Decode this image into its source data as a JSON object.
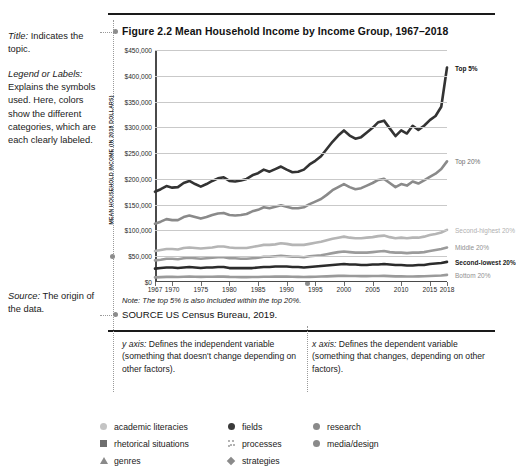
{
  "annotations": {
    "title_note": {
      "lead": "Title:",
      "body": " Indicates the topic."
    },
    "legend_note": {
      "lead": "Legend or Labels:",
      "body": " Explains the symbols used. Here, colors show the different categories, which are each clearly labeled."
    },
    "source_note": {
      "lead": "Source:",
      "body": " The origin of the data."
    },
    "y_axis_def": {
      "lead": "y axis:",
      "body": " Defines the independent variable (something that doesn't change depending on other factors)."
    },
    "x_axis_def": {
      "lead": "x axis:",
      "body": " Defines the dependent variable (something that changes, depending on other factors)."
    }
  },
  "figure": {
    "title": "Figure 2.2  Mean Household Income by Income Group, 1967–2018",
    "note": "Note: The top 5% is also included within the top 20%.",
    "source": "SOURCE  US Census Bureau, 2019."
  },
  "chart_data": {
    "type": "line",
    "title": "Figure 2.2  Mean Household Income by Income Group, 1967–2018",
    "xlabel": "",
    "ylabel": "MEAN HOUSEHOLD INCOME (IN 2018 DOLLARS)",
    "ylim": [
      0,
      450000
    ],
    "ytick_values": [
      0,
      50000,
      100000,
      150000,
      200000,
      250000,
      300000,
      350000,
      400000,
      450000
    ],
    "ytick_labels": [
      "$0",
      "$50,000",
      "$100,000",
      "$150,000",
      "$200,000",
      "$250,000",
      "$300,000",
      "$350,000",
      "$400,000",
      "$450,000"
    ],
    "xlim": [
      1967,
      2018
    ],
    "xtick_values": [
      1967,
      1970,
      1975,
      1980,
      1985,
      1990,
      1995,
      2000,
      2005,
      2010,
      2015,
      2018
    ],
    "xtick_labels": [
      "1967",
      "1970",
      "1975",
      "1980",
      "1985",
      "1990",
      "1995",
      "2000",
      "2005",
      "2010",
      "2015",
      "2018"
    ],
    "grid": "horizontal",
    "legend_position": "right-inline",
    "x": [
      1967,
      1968,
      1969,
      1970,
      1971,
      1972,
      1973,
      1974,
      1975,
      1976,
      1977,
      1978,
      1979,
      1980,
      1981,
      1982,
      1983,
      1984,
      1985,
      1986,
      1987,
      1988,
      1989,
      1990,
      1991,
      1992,
      1993,
      1994,
      1995,
      1996,
      1997,
      1998,
      1999,
      2000,
      2001,
      2002,
      2003,
      2004,
      2005,
      2006,
      2007,
      2008,
      2009,
      2010,
      2011,
      2012,
      2013,
      2014,
      2015,
      2016,
      2017,
      2018
    ],
    "series": [
      {
        "name": "Top 5%",
        "color": "#333333",
        "values": [
          175000,
          180000,
          186000,
          183000,
          184000,
          192000,
          196000,
          190000,
          185000,
          190000,
          196000,
          201000,
          203000,
          196000,
          195000,
          197000,
          200000,
          207000,
          211000,
          218000,
          214000,
          219000,
          224000,
          218000,
          213000,
          214000,
          218000,
          228000,
          235000,
          244000,
          258000,
          272000,
          284000,
          294000,
          284000,
          278000,
          281000,
          290000,
          299000,
          310000,
          313000,
          298000,
          283000,
          294000,
          288000,
          303000,
          295000,
          303000,
          314000,
          322000,
          340000,
          416000
        ]
      },
      {
        "name": "Top 20%",
        "color": "#8a8a8a",
        "values": [
          113000,
          117000,
          122000,
          120000,
          120000,
          126000,
          129000,
          126000,
          123000,
          126000,
          130000,
          133000,
          134000,
          130000,
          129000,
          130000,
          132000,
          137000,
          140000,
          145000,
          143000,
          146000,
          149000,
          146000,
          143000,
          143000,
          145000,
          151000,
          156000,
          161000,
          169000,
          178000,
          184000,
          190000,
          184000,
          180000,
          182000,
          187000,
          192000,
          198000,
          200000,
          192000,
          184000,
          190000,
          187000,
          195000,
          191000,
          197000,
          204000,
          210000,
          219000,
          234000
        ]
      },
      {
        "name": "Second-highest 20%",
        "color": "#b5b5b5",
        "values": [
          60000,
          62000,
          64000,
          64000,
          63000,
          66000,
          67000,
          66000,
          65000,
          66000,
          67000,
          69000,
          69000,
          67000,
          66000,
          66000,
          66000,
          68000,
          70000,
          72000,
          72000,
          73000,
          75000,
          74000,
          72000,
          72000,
          72000,
          74000,
          76000,
          78000,
          81000,
          84000,
          86000,
          88000,
          86000,
          85000,
          85000,
          86000,
          87000,
          89000,
          90000,
          87000,
          85000,
          86000,
          85000,
          86000,
          86000,
          88000,
          91000,
          93000,
          96000,
          101000
        ]
      },
      {
        "name": "Middle 20%",
        "color": "#9b9b9b",
        "values": [
          42000,
          43000,
          45000,
          45000,
          44000,
          46000,
          47000,
          46000,
          45000,
          46000,
          47000,
          48000,
          48000,
          46000,
          46000,
          45000,
          45000,
          46000,
          47000,
          49000,
          49000,
          50000,
          51000,
          50000,
          49000,
          49000,
          48000,
          50000,
          51000,
          52000,
          54000,
          56000,
          58000,
          59000,
          58000,
          57000,
          57000,
          57000,
          58000,
          59000,
          60000,
          58000,
          57000,
          57000,
          56000,
          57000,
          57000,
          58000,
          60000,
          62000,
          64000,
          67000
        ]
      },
      {
        "name": "Second-lowest 20%",
        "color": "#2b2b2b",
        "values": [
          26000,
          27000,
          28000,
          28000,
          27000,
          28000,
          29000,
          28000,
          27000,
          28000,
          28000,
          29000,
          29000,
          27000,
          27000,
          27000,
          27000,
          27000,
          28000,
          29000,
          29000,
          30000,
          30000,
          30000,
          29000,
          29000,
          28000,
          29000,
          30000,
          31000,
          32000,
          33000,
          34000,
          35000,
          34000,
          34000,
          33000,
          33000,
          34000,
          34000,
          35000,
          34000,
          33000,
          33000,
          32000,
          32000,
          33000,
          33000,
          35000,
          36000,
          37000,
          39000
        ]
      },
      {
        "name": "Bottom 20%",
        "color": "#9a9a9a",
        "values": [
          9000,
          9500,
          10000,
          10000,
          9800,
          10200,
          10500,
          10200,
          10000,
          10200,
          10300,
          10600,
          10500,
          9900,
          9700,
          9500,
          9500,
          9600,
          9800,
          10200,
          10300,
          10500,
          10700,
          10400,
          10100,
          9900,
          9700,
          10000,
          10300,
          10600,
          11000,
          11400,
          11800,
          12000,
          11700,
          11500,
          11400,
          11400,
          11500,
          11600,
          11800,
          11300,
          11000,
          11000,
          10800,
          10800,
          11000,
          11200,
          11700,
          12100,
          12600,
          13800
        ]
      }
    ],
    "series_label_styles": [
      {
        "name": "Top 5%",
        "bold": true,
        "color": "#111111"
      },
      {
        "name": "Top 20%",
        "bold": false,
        "color": "#6d6d6d"
      },
      {
        "name": "Second-highest 20%",
        "bold": false,
        "color": "#b0b0b0"
      },
      {
        "name": "Middle 20%",
        "bold": false,
        "color": "#8f8f8f"
      },
      {
        "name": "Second-lowest 20%",
        "bold": true,
        "color": "#1a1a1a"
      },
      {
        "name": "Bottom 20%",
        "bold": false,
        "color": "#8f8f8f"
      }
    ]
  },
  "bottom_legend": {
    "columns": [
      {
        "items": [
          {
            "label": "academic literacies",
            "icon": "circle-light-icon",
            "shape": "circle",
            "color": "#c4c4c4"
          },
          {
            "label": "rhetorical situations",
            "icon": "square-gray-icon",
            "shape": "square",
            "color": "#6e6e6e"
          },
          {
            "label": "genres",
            "icon": "triangle-gray-icon",
            "shape": "triangle",
            "color": "#8a8a8a"
          }
        ]
      },
      {
        "items": [
          {
            "label": "fields",
            "icon": "circle-dark-icon",
            "shape": "circle",
            "color": "#3a3a3a"
          },
          {
            "label": "processes",
            "icon": "dots-cluster-icon",
            "shape": "dots",
            "color": "#9a9a9a"
          },
          {
            "label": "strategies",
            "icon": "diamond-gray-icon",
            "shape": "diamond",
            "color": "#8a8a8a"
          }
        ]
      },
      {
        "items": [
          {
            "label": "research",
            "icon": "circle-medium-icon",
            "shape": "circle",
            "color": "#8a8a8a"
          },
          {
            "label": "media/design",
            "icon": "circle-medium2-icon",
            "shape": "circle",
            "color": "#8a8a8a"
          }
        ]
      }
    ]
  }
}
